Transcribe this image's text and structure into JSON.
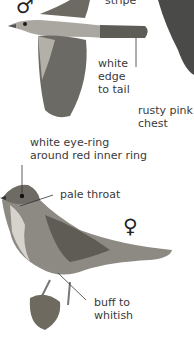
{
  "figure": {
    "male": {
      "symbol": "♂",
      "labels": {
        "stripe": "stripe",
        "tail_line1": "white",
        "tail_line2": "edge",
        "tail_line3": "to tail"
      }
    },
    "chest_label_line1": "rusty pink",
    "chest_label_line2": "chest",
    "female": {
      "symbol": "♀",
      "labels": {
        "eye_line1": "white eye-ring",
        "eye_line2": "around red inner ring",
        "throat": "pale throat",
        "belly_line1": "buff to",
        "belly_line2": "whitish"
      }
    }
  }
}
